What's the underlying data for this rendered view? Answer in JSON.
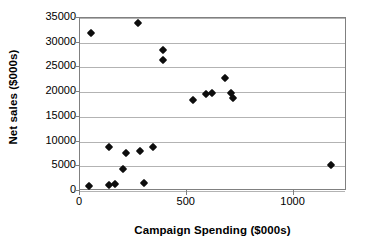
{
  "chart_data": {
    "type": "scatter",
    "title": "",
    "xlabel": "Campaign Spending ($000s)",
    "ylabel": "Net sales ($000s)",
    "xlim": [
      0,
      1250
    ],
    "ylim": [
      0,
      35000
    ],
    "xticks": [
      0,
      500,
      1000
    ],
    "xtick_labels": [
      "0",
      "500",
      "1000"
    ],
    "yticks": [
      0,
      5000,
      10000,
      15000,
      20000,
      25000,
      30000,
      35000
    ],
    "ytick_labels": [
      "0",
      "5000",
      "10000",
      "15000",
      "20000",
      "25000",
      "30000",
      "35000"
    ],
    "grid": "horizontal",
    "legend": "none",
    "marker": "filled-diamond",
    "marker_color": "#0d0d0d",
    "points": [
      {
        "x": 50,
        "y": 32000
      },
      {
        "x": 270,
        "y": 34000
      },
      {
        "x": 390,
        "y": 28500
      },
      {
        "x": 390,
        "y": 26500
      },
      {
        "x": 680,
        "y": 22900
      },
      {
        "x": 590,
        "y": 19700
      },
      {
        "x": 620,
        "y": 19800
      },
      {
        "x": 705,
        "y": 19800
      },
      {
        "x": 715,
        "y": 18800
      },
      {
        "x": 530,
        "y": 18400
      },
      {
        "x": 135,
        "y": 8900
      },
      {
        "x": 215,
        "y": 7600
      },
      {
        "x": 280,
        "y": 8100
      },
      {
        "x": 340,
        "y": 9000
      },
      {
        "x": 200,
        "y": 4450
      },
      {
        "x": 1175,
        "y": 5200
      },
      {
        "x": 40,
        "y": 1000
      },
      {
        "x": 135,
        "y": 1200
      },
      {
        "x": 165,
        "y": 1400
      },
      {
        "x": 300,
        "y": 1550
      }
    ]
  },
  "colors": {
    "marker": "#0d0d0d",
    "gridline": "#b3b3b3",
    "frame": "#808080",
    "text": "#000000",
    "background": "#ffffff"
  }
}
